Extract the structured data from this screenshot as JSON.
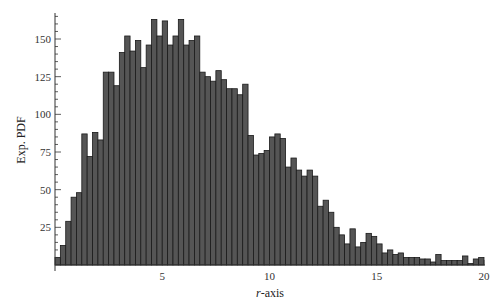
{
  "chart_data": {
    "type": "bar",
    "title": "",
    "xlabel": "r-axis",
    "ylabel": "Exp. PDF",
    "xlim": [
      0,
      20
    ],
    "ylim": [
      0,
      170
    ],
    "bin_width": 0.25,
    "x_ticks": [
      5,
      10,
      15,
      20
    ],
    "y_ticks": [
      25,
      50,
      75,
      100,
      125,
      150
    ],
    "grid": false,
    "legend": null,
    "bar_color": "#555555",
    "bar_edge_color": "#1a1a1a",
    "values": [
      5,
      13,
      29,
      45,
      48,
      87,
      72,
      88,
      83,
      128,
      128,
      119,
      141,
      152,
      142,
      149,
      131,
      146,
      163,
      152,
      162,
      146,
      152,
      163,
      146,
      149,
      152,
      128,
      125,
      122,
      129,
      123,
      117,
      117,
      113,
      120,
      86,
      73,
      74,
      76,
      85,
      87,
      84,
      65,
      71,
      63,
      59,
      63,
      59,
      39,
      43,
      35,
      25,
      20,
      14,
      24,
      12,
      15,
      21,
      19,
      14,
      8,
      10,
      7,
      8,
      5,
      5,
      5,
      4,
      4,
      2,
      7,
      3,
      3,
      3,
      3,
      6,
      1,
      4,
      5
    ]
  },
  "axes": {
    "x_label_italic": "r",
    "x_label_rest": "-axis",
    "y_label": "Exp. PDF"
  }
}
